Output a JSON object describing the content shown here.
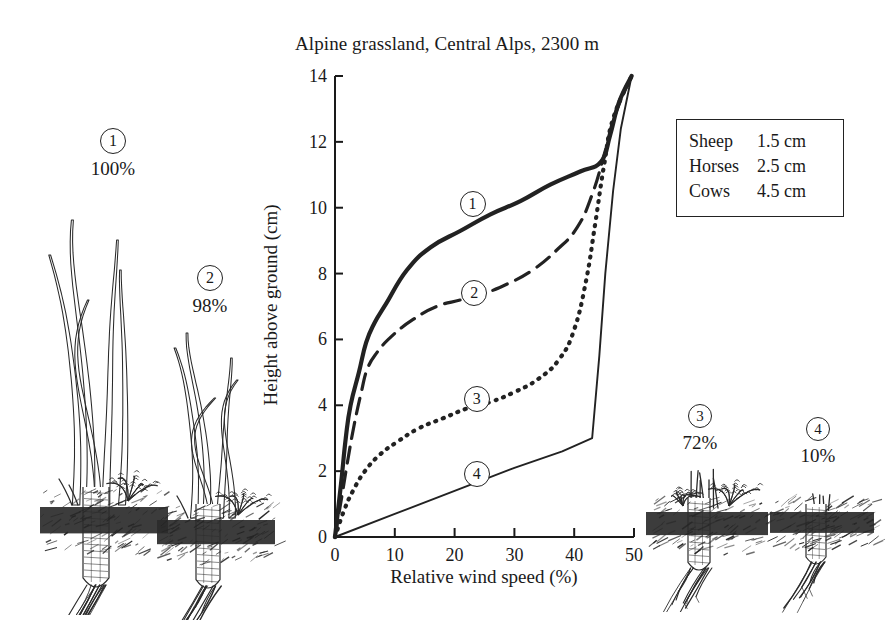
{
  "chart_data": {
    "type": "line",
    "title": "Alpine grassland, Central Alps, 2300 m",
    "xlabel": "Relative wind speed (%)",
    "ylabel": "Height above ground (cm)",
    "xlim": [
      0,
      50
    ],
    "ylim": [
      0,
      14
    ],
    "xticks": [
      "0",
      "10",
      "20",
      "30",
      "40",
      "50"
    ],
    "yticks": [
      "0",
      "2",
      "4",
      "6",
      "8",
      "10",
      "12",
      "14"
    ],
    "grid": false,
    "legend_position": "none",
    "series": [
      {
        "name": "1",
        "label": "1",
        "style": "solid-thick",
        "canopy_percent": "100%",
        "points": [
          [
            0,
            0
          ],
          [
            1.0,
            1.6
          ],
          [
            1.8,
            3.0
          ],
          [
            2.6,
            4.0
          ],
          [
            4.0,
            5.0
          ],
          [
            5.2,
            5.9
          ],
          [
            6.6,
            6.5
          ],
          [
            8.6,
            7.1
          ],
          [
            12.0,
            8.1
          ],
          [
            16.0,
            8.8
          ],
          [
            21.0,
            9.3
          ],
          [
            26.0,
            9.8
          ],
          [
            31.0,
            10.2
          ],
          [
            36.0,
            10.7
          ],
          [
            41.0,
            11.1
          ],
          [
            44.5,
            11.4
          ],
          [
            46.0,
            12.2
          ],
          [
            47.5,
            13.2
          ],
          [
            49.6,
            14.0
          ]
        ]
      },
      {
        "name": "2",
        "label": "2",
        "style": "dashed",
        "canopy_percent": "98%",
        "points": [
          [
            0,
            0
          ],
          [
            1.2,
            1.3
          ],
          [
            2.2,
            2.4
          ],
          [
            3.2,
            3.4
          ],
          [
            4.4,
            4.4
          ],
          [
            5.4,
            5.1
          ],
          [
            7.0,
            5.6
          ],
          [
            9.5,
            6.1
          ],
          [
            13.0,
            6.6
          ],
          [
            17.0,
            7.0
          ],
          [
            21.0,
            7.2
          ],
          [
            25.0,
            7.4
          ],
          [
            29.0,
            7.7
          ],
          [
            33.0,
            8.1
          ],
          [
            37.0,
            8.7
          ],
          [
            40.5,
            9.4
          ],
          [
            43.0,
            10.4
          ],
          [
            45.0,
            11.6
          ],
          [
            46.8,
            12.8
          ],
          [
            49.6,
            14.0
          ]
        ]
      },
      {
        "name": "3",
        "label": "3",
        "style": "dotted",
        "canopy_percent": "72%",
        "points": [
          [
            0,
            0
          ],
          [
            1.5,
            0.8
          ],
          [
            3.0,
            1.4
          ],
          [
            5.0,
            2.0
          ],
          [
            7.5,
            2.5
          ],
          [
            10.5,
            2.9
          ],
          [
            14.0,
            3.3
          ],
          [
            18.0,
            3.6
          ],
          [
            22.0,
            3.9
          ],
          [
            26.0,
            4.1
          ],
          [
            30.0,
            4.4
          ],
          [
            34.0,
            4.8
          ],
          [
            37.5,
            5.4
          ],
          [
            40.0,
            6.3
          ],
          [
            42.0,
            7.8
          ],
          [
            43.5,
            9.5
          ],
          [
            45.0,
            11.3
          ],
          [
            46.5,
            12.7
          ],
          [
            49.6,
            14.0
          ]
        ]
      },
      {
        "name": "4",
        "label": "4",
        "style": "solid-thin",
        "canopy_percent": "10%",
        "points": [
          [
            0,
            0
          ],
          [
            10,
            0.7
          ],
          [
            20,
            1.4
          ],
          [
            30,
            2.1
          ],
          [
            38,
            2.6
          ],
          [
            43,
            3.0
          ],
          [
            44.2,
            5.5
          ],
          [
            45.2,
            8.0
          ],
          [
            46.5,
            10.5
          ],
          [
            47.8,
            12.4
          ],
          [
            49.6,
            14.0
          ]
        ]
      }
    ],
    "inplot_labels": [
      {
        "text": "1",
        "x": 23.0,
        "y": 10.1
      },
      {
        "text": "2",
        "x": 23.3,
        "y": 7.4
      },
      {
        "text": "3",
        "x": 23.7,
        "y": 4.2
      },
      {
        "text": "4",
        "x": 23.7,
        "y": 1.9
      }
    ]
  },
  "legend": {
    "rows": [
      {
        "animal": "Sheep",
        "height": "1.5 cm"
      },
      {
        "animal": "Horses",
        "height": "2.5 cm"
      },
      {
        "animal": "Cows",
        "height": "4.5 cm"
      }
    ]
  },
  "plants": [
    {
      "id": "1",
      "number": "1",
      "percent": "100%",
      "size": "tall"
    },
    {
      "id": "2",
      "number": "2",
      "percent": "98%",
      "size": "tall"
    },
    {
      "id": "3",
      "number": "3",
      "percent": "72%",
      "size": "short"
    },
    {
      "id": "4",
      "number": "4",
      "percent": "10%",
      "size": "shortest"
    }
  ],
  "colors": {
    "ink": "#1a1a1a",
    "line": "#222222",
    "background": "#ffffff"
  }
}
